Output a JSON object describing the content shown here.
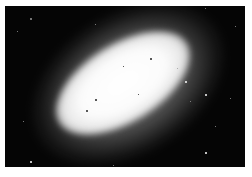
{
  "image": {
    "subject": "elliptical galaxy",
    "description": "Bright elongated elliptical glow tilted diagonally (lower-left to upper-right) on a black starfield, with scattered foreground stars, framed by a thin white border",
    "colors": {
      "background": "#050505",
      "core": "#ffffff",
      "border": "#ffffff"
    },
    "stars": [
      {
        "x": 25,
        "y": 12,
        "size": 2,
        "tone": "dim"
      },
      {
        "x": 12,
        "y": 25,
        "size": 1,
        "tone": "dim"
      },
      {
        "x": 90,
        "y": 18,
        "size": 1,
        "tone": "dim"
      },
      {
        "x": 200,
        "y": 2,
        "size": 1,
        "tone": "dim"
      },
      {
        "x": 230,
        "y": 20,
        "size": 1,
        "tone": "dim"
      },
      {
        "x": 200,
        "y": 88,
        "size": 2,
        "tone": "bright"
      },
      {
        "x": 185,
        "y": 95,
        "size": 1,
        "tone": "dim"
      },
      {
        "x": 180,
        "y": 75,
        "size": 2,
        "tone": "bright"
      },
      {
        "x": 225,
        "y": 92,
        "size": 1,
        "tone": "dim"
      },
      {
        "x": 18,
        "y": 115,
        "size": 1,
        "tone": "dim"
      },
      {
        "x": 25,
        "y": 155,
        "size": 2,
        "tone": "bright"
      },
      {
        "x": 200,
        "y": 146,
        "size": 2,
        "tone": "bright"
      },
      {
        "x": 210,
        "y": 120,
        "size": 1,
        "tone": "dim"
      },
      {
        "x": 108,
        "y": 159,
        "size": 1,
        "tone": "dim"
      },
      {
        "x": 145,
        "y": 52,
        "size": 2,
        "tone": "dark"
      },
      {
        "x": 118,
        "y": 60,
        "size": 1,
        "tone": "dark"
      },
      {
        "x": 90,
        "y": 93,
        "size": 2,
        "tone": "dark"
      },
      {
        "x": 81,
        "y": 104,
        "size": 2,
        "tone": "dark"
      },
      {
        "x": 133,
        "y": 88,
        "size": 1,
        "tone": "dark"
      },
      {
        "x": 172,
        "y": 62,
        "size": 1,
        "tone": "dim"
      }
    ]
  }
}
